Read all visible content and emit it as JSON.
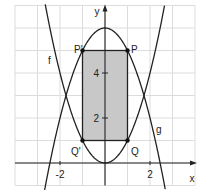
{
  "diagram": {
    "title": "",
    "axes": {
      "x_label": "x",
      "y_label": "y",
      "x_ticks": [
        {
          "value": -2,
          "label": "-2"
        },
        {
          "value": 2,
          "label": "2"
        }
      ],
      "y_ticks": [
        {
          "value": 2,
          "label": "2"
        },
        {
          "value": 4,
          "label": "4"
        }
      ],
      "x_range": [
        -4,
        4
      ],
      "y_range": [
        -1,
        7
      ],
      "grid": true
    },
    "curves": [
      {
        "name": "f",
        "label": "f",
        "equation": "y = x^2",
        "color": "#222222"
      },
      {
        "name": "g",
        "label": "g",
        "equation": "y = 6 - x^2",
        "color": "#222222"
      }
    ],
    "points": [
      {
        "label": "P'",
        "x": -1,
        "y": 5
      },
      {
        "label": "P",
        "x": 1,
        "y": 5
      },
      {
        "label": "Q'",
        "x": -1,
        "y": 1
      },
      {
        "label": "Q",
        "x": 1,
        "y": 1
      }
    ],
    "rectangle": {
      "vertices": [
        "P'",
        "P",
        "Q",
        "Q'"
      ],
      "fill": "#c8c8c8"
    },
    "colors": {
      "grid": "#dcdcdc",
      "axis": "#222222",
      "curve": "#222222",
      "shade": "#c8c8c8"
    }
  }
}
